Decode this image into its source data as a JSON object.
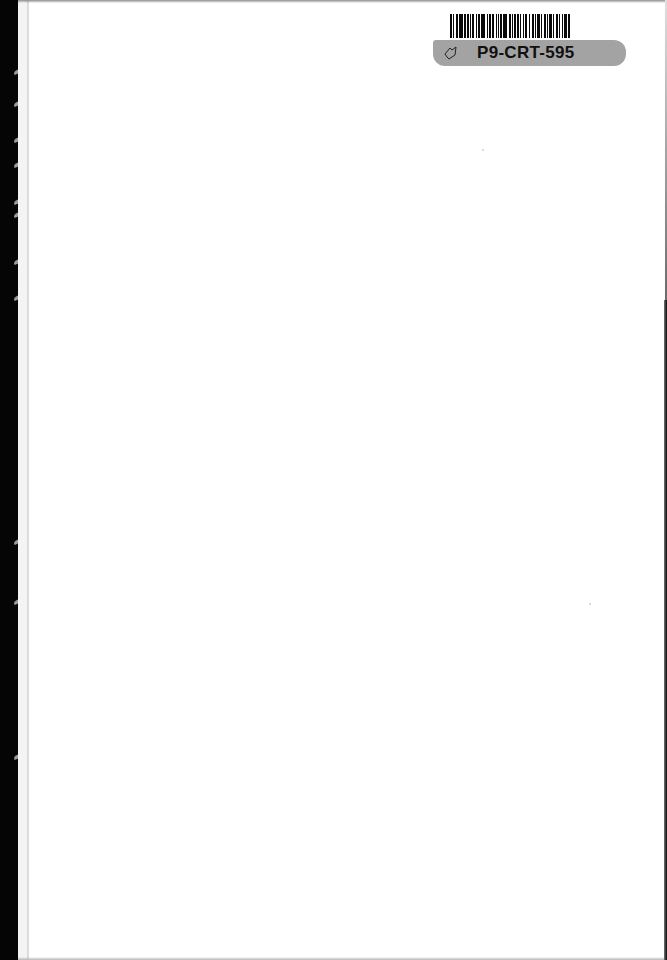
{
  "document": {
    "type": "scanned-blank-page",
    "body_text": ""
  },
  "barcode_sticker": {
    "label": "P9-CRT-595",
    "icon": "tag-outline-icon",
    "label_bg_color": "#a3a3a3",
    "text_color": "#111111",
    "bar_pattern": [
      2,
      1,
      1,
      2,
      2,
      1,
      3,
      1,
      2,
      1,
      2,
      1,
      1,
      1,
      2,
      2,
      1,
      1,
      2,
      1,
      3,
      2,
      1,
      1,
      2,
      1,
      2,
      2,
      1,
      1,
      1,
      1,
      2,
      1,
      3,
      2,
      2,
      1,
      1,
      1,
      2,
      1,
      2,
      1,
      1,
      2,
      1,
      1,
      2,
      1,
      1,
      2,
      2,
      1,
      1,
      1,
      3,
      1,
      1,
      2,
      2,
      1,
      1,
      1,
      2,
      1,
      1,
      2,
      2,
      1,
      1,
      2,
      1,
      1,
      3,
      1,
      2,
      2
    ]
  },
  "colors": {
    "page": "#ffffff",
    "binding": "#050505",
    "edge_line": "#dcdcdc"
  }
}
